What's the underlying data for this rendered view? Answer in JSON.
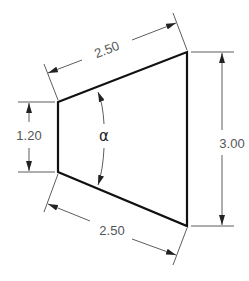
{
  "diagram": {
    "type": "dimensioned-trapezoid",
    "colors": {
      "outline": "#111111",
      "dimension": "#333333",
      "text": "#555555"
    },
    "shape": {
      "vertices": [
        [
          58,
          102
        ],
        [
          187,
          52
        ],
        [
          187,
          226
        ],
        [
          58,
          172
        ]
      ]
    },
    "dimensions": {
      "top_slant": {
        "label": "2.50"
      },
      "bottom_slant": {
        "label": "2.50"
      },
      "left_height": {
        "label": "1.20"
      },
      "right_height": {
        "label": "3.00"
      },
      "angle": {
        "label": "α"
      }
    }
  }
}
